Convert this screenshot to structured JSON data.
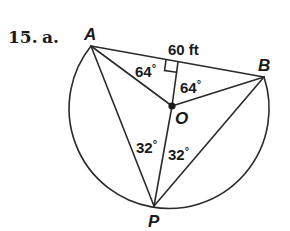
{
  "problem": {
    "number": "15.",
    "part": "a."
  },
  "points": {
    "A": {
      "label": "A",
      "x": 91,
      "y": 46
    },
    "B": {
      "label": "B",
      "x": 264,
      "y": 77
    },
    "O": {
      "label": "O",
      "x": 172,
      "y": 106
    },
    "P": {
      "label": "P",
      "x": 154,
      "y": 206
    }
  },
  "measurements": {
    "chord_length": "60 ft",
    "angle_AO_perp": "64",
    "angle_BO_perp": "64",
    "angle_APO": "32",
    "angle_OPB": "32",
    "degree_symbol": "°"
  },
  "colors": {
    "stroke": "#2a2a2a",
    "text": "#1a1a1a",
    "background": "#ffffff"
  }
}
